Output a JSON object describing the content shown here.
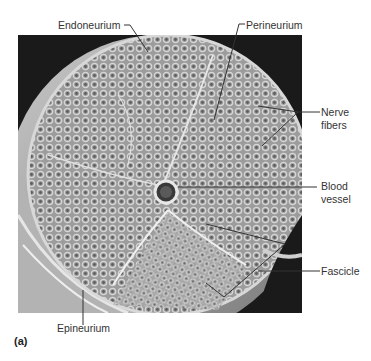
{
  "figure": {
    "panel_letter": "(a)",
    "labels": {
      "endoneurium": "Endoneurium",
      "perineurium": "Perineurium",
      "nerve_fibers_line1": "Nerve",
      "nerve_fibers_line2": "fibers",
      "blood_vessel_line1": "Blood",
      "blood_vessel_line2": "vessel",
      "fascicle": "Fascicle",
      "epineurium": "Epineurium"
    },
    "colors": {
      "background": "#ffffff",
      "photo_background": "#1a1a1a",
      "tissue_light": "#bdbdbd",
      "tissue_mid": "#8f8f8f",
      "leader_line": "#333333"
    }
  }
}
